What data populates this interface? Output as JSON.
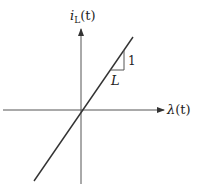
{
  "diagram": {
    "type": "linear characteristic plot",
    "y_axis": {
      "label_main": "i",
      "label_sub": "L",
      "label_arg": "(t)"
    },
    "x_axis": {
      "label_main": "λ",
      "label_arg": "(t)"
    },
    "slope_triangle": {
      "run_label": "L",
      "rise_label": "1"
    },
    "colors": {
      "line": "#333333",
      "axis": "#555555",
      "text": "#222222"
    }
  }
}
